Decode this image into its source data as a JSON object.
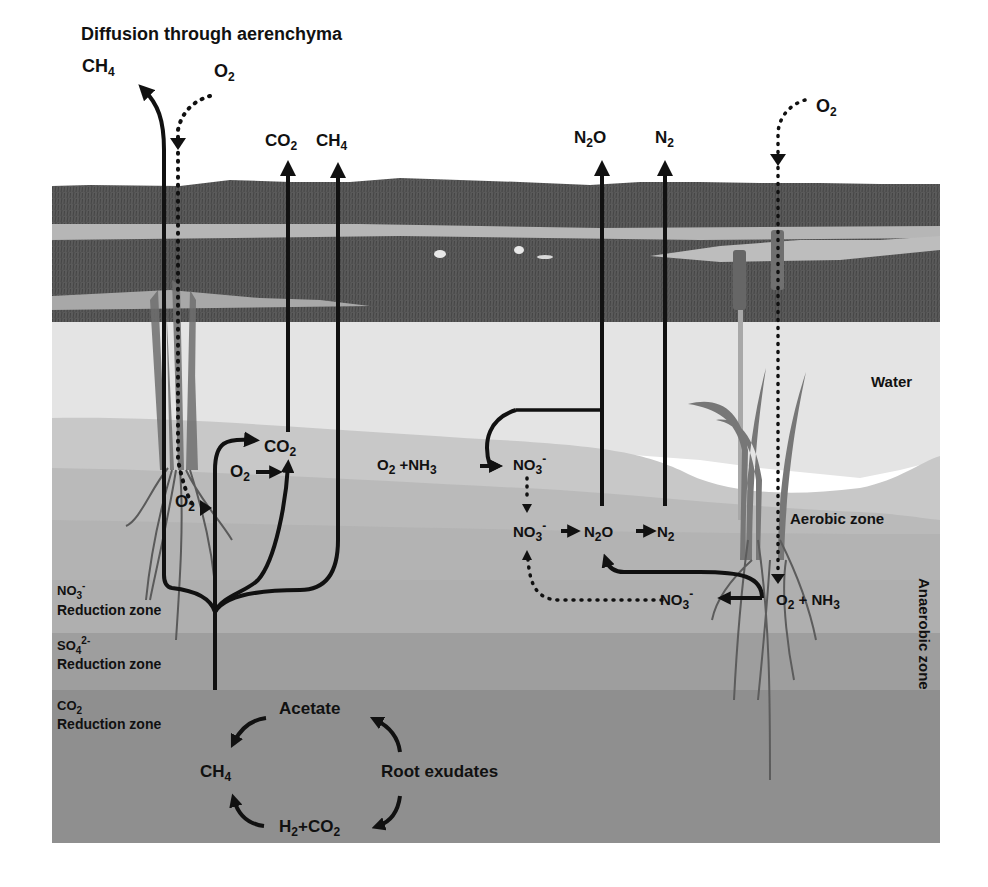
{
  "title": "Diffusion through aerenchyma",
  "colors": {
    "background": "#ffffff",
    "marsh_sky_edge": "#5f5f5f",
    "marsh_vegetation": "#595959",
    "marsh_water": "#b4b4b4",
    "water": "#e4e4e4",
    "aerobic_upper": "#c6c6c6",
    "aerobic_lower": "#b8b8b8",
    "no3_reduction": "#aeaeae",
    "so4_reduction": "#9d9d9d",
    "co2_reduction": "#8e8e8e",
    "arrow": "#111111"
  },
  "zones": {
    "water": "Water",
    "aerobic": "Aerobic zone",
    "anaerobic": "Anaerobic zone",
    "no3_reduction": {
      "species": "NO",
      "sub": "3",
      "sup": "-",
      "label": "Reduction zone"
    },
    "so4_reduction": {
      "species": "SO",
      "sub": "4",
      "sup": "2-",
      "label": "Reduction zone"
    },
    "co2_reduction": {
      "species": "CO",
      "sub": "2",
      "sup": "",
      "label": "Reduction zone"
    }
  },
  "gases_top": {
    "ch4_left": {
      "base": "CH",
      "sub": "4"
    },
    "o2_left": {
      "base": "O",
      "sub": "2"
    },
    "co2": {
      "base": "CO",
      "sub": "2"
    },
    "ch4": {
      "base": "CH",
      "sub": "4"
    },
    "n2o": {
      "base1": "N",
      "sub": "2",
      "base2": "O"
    },
    "n2": {
      "base": "N",
      "sub": "2"
    },
    "o2_right": {
      "base": "O",
      "sub": "2"
    }
  },
  "left_processes": {
    "co2_oxidation": {
      "base": "CO",
      "sub": "2"
    },
    "o2_input": {
      "base": "O",
      "sub": "2"
    },
    "o2_root": {
      "base": "O",
      "sub": "2"
    }
  },
  "nitrogen_cycle": {
    "nitrification_reactants": {
      "o2": "O",
      "o2_sub": "2",
      "plus": " +NH",
      "nh3_sub": "3"
    },
    "nitrate_top": {
      "base": "NO",
      "sub": "3",
      "sup": "-"
    },
    "nitrate_mid": {
      "base": "NO",
      "sub": "3",
      "sup": "-"
    },
    "n2o_mid": {
      "base1": "N",
      "sub": "2",
      "base2": "O"
    },
    "n2_mid": {
      "base": "N",
      "sub": "2"
    },
    "nitrate_root": {
      "base": "NO",
      "sub": "3",
      "sup": "-"
    },
    "root_reactants": {
      "o2": "O",
      "o2_sub": "2",
      "plus": " + NH",
      "nh3_sub": "3"
    }
  },
  "methanogenesis": {
    "acetate": "Acetate",
    "root_exudates": "Root exudates",
    "ch4": {
      "base": "CH",
      "sub": "4"
    },
    "h2_co2": {
      "h": "H",
      "h_sub": "2",
      "plus": "+CO",
      "co2_sub": "2"
    }
  }
}
